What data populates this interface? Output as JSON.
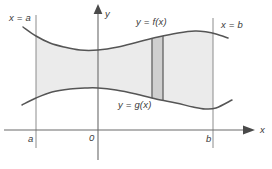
{
  "figure": {
    "type": "calculus-area-between-curves-diagram",
    "background_color": "#ffffff",
    "width": 272,
    "height": 169
  },
  "labels": {
    "x_equals_a": "x = a",
    "x_equals_b": "x = b",
    "y_equals_f": "y = f(x)",
    "y_equals_g": "y = g(x)",
    "tick_a": "a",
    "tick_zero": "0",
    "tick_b": "b",
    "axis_y": "y",
    "axis_x": "x"
  },
  "colors": {
    "curve": "#555555",
    "axis": "#6b6b6b",
    "boundary_line": "#8c8c8c",
    "region_fill": "#ebebeb",
    "strip_fill": "#cfcfcf",
    "strip_edge": "#6a6a6a",
    "text": "#3a3a3a"
  },
  "chart_data": {
    "type": "line",
    "title": "",
    "xlabel": "x",
    "ylabel": "y",
    "grid": false,
    "legend": "inline-annotations",
    "axes": {
      "origin_px": [
        98,
        130
      ],
      "x_axis_y_px": 130,
      "y_axis_x_px": 98,
      "x_arrow_end_px": 248,
      "y_arrow_end_px": 8
    },
    "vertical_boundaries": [
      {
        "name": "x = a",
        "x_px": 36,
        "y_top_px": 15,
        "y_bottom_px": 148
      },
      {
        "name": "x = b",
        "x_px": 213,
        "y_top_px": 18,
        "y_bottom_px": 148
      }
    ],
    "series": [
      {
        "name": "y = f(x)",
        "role": "upper-curve",
        "points_px": [
          [
            23,
            27
          ],
          [
            36,
            36
          ],
          [
            50,
            43
          ],
          [
            64,
            47
          ],
          [
            80,
            50
          ],
          [
            98,
            50
          ],
          [
            118,
            47
          ],
          [
            138,
            42
          ],
          [
            158,
            37
          ],
          [
            178,
            33
          ],
          [
            195,
            31
          ],
          [
            207,
            32
          ],
          [
            216,
            34
          ],
          [
            228,
            38
          ]
        ]
      },
      {
        "name": "y = g(x)",
        "role": "lower-curve",
        "points_px": [
          [
            22,
            105
          ],
          [
            36,
            98
          ],
          [
            52,
            92
          ],
          [
            70,
            89
          ],
          [
            86,
            88
          ],
          [
            98,
            88
          ],
          [
            116,
            90
          ],
          [
            136,
            94
          ],
          [
            156,
            99
          ],
          [
            176,
            103
          ],
          [
            193,
            107
          ],
          [
            205,
            109
          ],
          [
            216,
            108
          ],
          [
            232,
            100
          ]
        ]
      }
    ],
    "shaded_region": {
      "description": "Region between y = f(x) and y = g(x) from x = a to x = b",
      "x_start_px": 36,
      "x_end_px": 213,
      "fill": "#ebebeb"
    },
    "representative_strip": {
      "description": "Representative vertical rectangle of width dx inside the region",
      "x_left_px": 152,
      "x_right_px": 163,
      "fill": "#cfcfcf"
    }
  }
}
